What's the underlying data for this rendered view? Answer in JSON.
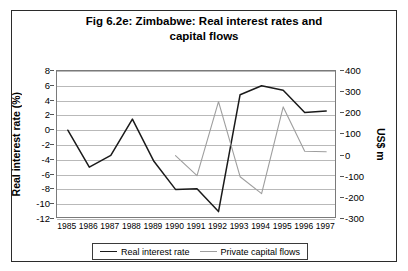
{
  "chart_data": {
    "type": "line",
    "title": "Fig 6.2e: Zimbabwe: Real interest rates and capital flows",
    "title_line1": "Fig 6.2e: Zimbabwe: Real interest rates and",
    "title_line2": "capital flows",
    "xlabel": "",
    "ylabel": "Real interest rate (%)",
    "ylabel_right": "US$ m",
    "grid": true,
    "legend_position": "bottom",
    "categories": [
      "1985",
      "1986",
      "1987",
      "1988",
      "1989",
      "1990",
      "1991",
      "1992",
      "1993",
      "1994",
      "1995",
      "1996",
      "1997"
    ],
    "ylim": [
      -12,
      8
    ],
    "yticks": [
      8,
      6,
      4,
      2,
      0,
      -2,
      -4,
      -6,
      -8,
      -10,
      -12
    ],
    "ylim_right": [
      -300,
      400
    ],
    "yticks_right": [
      400,
      300,
      200,
      100,
      0,
      -100,
      -200,
      -300
    ],
    "series": [
      {
        "name": "Real interest rate",
        "axis": "left",
        "color": "#1a1a1a",
        "values": [
          0,
          -5,
          -3.4,
          1.5,
          -4.2,
          -8,
          -7.9,
          -11,
          4.8,
          6,
          5.4,
          2.4,
          2.6
        ]
      },
      {
        "name": "Private capital flows",
        "axis": "right",
        "color": "#9e9e9e",
        "values": [
          null,
          null,
          null,
          null,
          null,
          0,
          -95,
          255,
          -100,
          -180,
          230,
          20,
          18
        ]
      }
    ]
  },
  "legend": {
    "entries": [
      {
        "label": "Real interest rate",
        "color": "#1a1a1a"
      },
      {
        "label": "Private capital flows",
        "color": "#9e9e9e"
      }
    ]
  }
}
